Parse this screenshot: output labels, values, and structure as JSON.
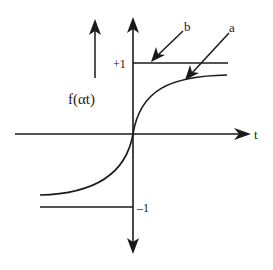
{
  "diagram": {
    "y_label": "f(αt)",
    "x_label": "t",
    "tick_plus": "+1",
    "tick_minus": "–1",
    "arrow_a_label": "a",
    "arrow_b_label": "b",
    "colors": {
      "stroke": "#1a1a1a",
      "background": "#ffffff"
    }
  }
}
